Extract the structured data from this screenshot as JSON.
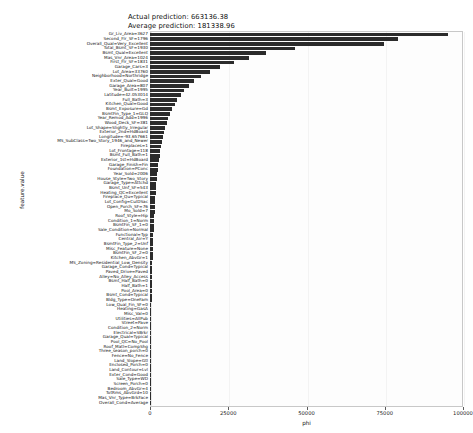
{
  "annotations": {
    "actual": "Actual prediction: 663136.38",
    "average": "Average prediction: 181338.96"
  },
  "chart_data": {
    "type": "bar",
    "orientation": "horizontal",
    "title": "",
    "xlabel": "phi",
    "ylabel": "feature.value",
    "xlim": [
      0,
      100000
    ],
    "xticks": [
      0,
      25000,
      50000,
      75000,
      100000
    ],
    "xticklabels": [
      "0",
      "25000",
      "50000",
      "75000",
      "100000"
    ],
    "grid": true,
    "legend": null,
    "bar_color": "#2b2b2b",
    "categories": [
      "Gr_Liv_Area=3627",
      "Second_Flr_SF=1796",
      "Overall_Qual=Very_Excellent",
      "Total_Bsmt_SF=1930",
      "Bsmt_Qual=Excellent",
      "Mas_Vnr_Area=1024",
      "First_Flr_SF=1831",
      "Garage_Cars=3",
      "Lot_Area=33760",
      "Neighborhood=Northridge",
      "Exter_Qual=Good",
      "Garage_Area=807",
      "Year_Built=1995",
      "Latitude=42.053014",
      "Full_Bath=3",
      "Kitchen_Qual=Good",
      "Bsmt_Exposure=Gd",
      "BsmtFin_Type_1=GLQ",
      "Year_Remod_Add=1996",
      "Wood_Deck_SF=381",
      "Lot_Shape=Slightly_Irregular",
      "Exterior_2nd=HdBoard",
      "Longitude=-93.657661",
      "MS_SubClass=Two_Story_1946_and_Newer",
      "Fireplaces=1",
      "Lot_Frontage=118",
      "Bsmt_Full_Bath=1",
      "Exterior_1st=HdBoard",
      "Garage_Finish=Fin",
      "Foundation=PConc",
      "Year_Sold=2006",
      "House_Style=Two_Story",
      "Garage_Type=Attchd",
      "Bsmt_Unf_SF=543",
      "Heating_QC=Excellent",
      "Fireplace_Qu=Typical",
      "Lot_Config=CulDSac",
      "Open_Porch_SF=76",
      "Mo_Sold=7",
      "Roof_Style=Hip",
      "Condition_1=Norm",
      "BsmtFin_SF_1=0",
      "Sale_Condition=Normal",
      "Functional=Typ",
      "Central_Air=Y",
      "BsmtFin_Type_2=Unf",
      "Misc_Feature=None",
      "BsmtFin_SF_2=0",
      "Kitchen_AbvGr=1",
      "MS_Zoning=Residential_Low_Density",
      "Garage_Cond=Typical",
      "Paved_Drive=Paved",
      "Alley=No_Alley_Access",
      "Bsmt_Half_Bath=0",
      "Half_Bath=1",
      "Pool_Area=0",
      "Bsmt_Cond=Typical",
      "Bldg_Type=OneFam",
      "Low_Qual_Fin_SF=0",
      "Heating=GasA",
      "Misc_Val=0",
      "Utilities=AllPub",
      "Street=Pave",
      "Condition_2=Norm",
      "Electrical=SBrkr",
      "Garage_Qual=Typical",
      "Pool_QC=No_Pool",
      "Roof_Matl=CompShg",
      "Three_season_porch=0",
      "Fence=No_Fence",
      "Land_Slope=Gtl",
      "Enclosed_Porch=0",
      "Land_Contour=Lvl",
      "Exter_Cond=Good",
      "Sale_Type=WD",
      "Screen_Porch=0",
      "Bedroom_AbvGr=4",
      "TotRms_AbvGrd=10",
      "Mas_Vnr_Type=BrkFace",
      "Overall_Cond=Average"
    ],
    "values": [
      95200,
      79100,
      74800,
      46300,
      37200,
      31500,
      26900,
      22400,
      19100,
      16300,
      14100,
      12400,
      11000,
      9800,
      8700,
      7900,
      7100,
      6500,
      5900,
      5400,
      4950,
      4550,
      4200,
      3900,
      3600,
      3350,
      3100,
      2900,
      2700,
      2520,
      2360,
      2210,
      2070,
      1950,
      1830,
      1720,
      1620,
      1530,
      1440,
      1360,
      1280,
      1210,
      1140,
      1080,
      1020,
      960,
      910,
      860,
      810,
      770,
      725,
      685,
      645,
      610,
      575,
      540,
      510,
      480,
      450,
      425,
      400,
      375,
      350,
      330,
      308,
      288,
      268,
      250,
      232,
      215,
      198,
      182,
      166,
      151,
      136,
      122,
      108,
      94,
      72,
      48
    ]
  }
}
